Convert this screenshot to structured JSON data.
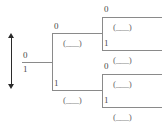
{
  "diagram": {
    "type": "binary-tree",
    "scale_arrow": {
      "icon": "double-headed-vertical-arrow",
      "top_label": "0",
      "bottom_label": "1"
    },
    "root": {
      "up_label": "0",
      "down_label": "1"
    },
    "level1": [
      {
        "label": "0",
        "placeholder": "(___)"
      },
      {
        "label": "1",
        "placeholder": "(___)"
      }
    ],
    "level2": [
      {
        "label": "0",
        "placeholder": "(___)"
      },
      {
        "label": "1",
        "placeholder": "(___)"
      },
      {
        "label": "0",
        "placeholder": "(___)"
      },
      {
        "label": "1",
        "placeholder": "(___)"
      }
    ],
    "colors": {
      "line": "#8a8a8a",
      "arrow": "#2b2b2b",
      "text": "#4a4a4a",
      "background": "#ffffff"
    }
  }
}
